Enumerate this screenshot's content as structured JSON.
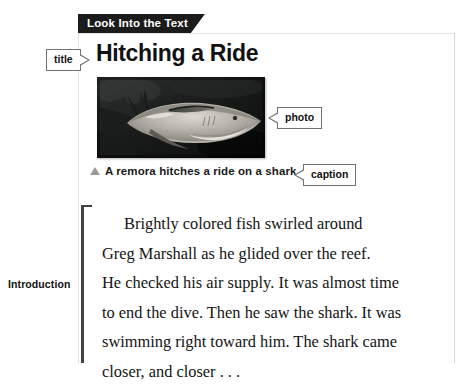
{
  "section_tab": {
    "label": "Look Into the Text"
  },
  "article": {
    "title": "Hitching a Ride",
    "caption": "A remora hitches a ride on a shark.",
    "caption_marker_icon": "triangle-up-icon",
    "photo_alt": "grayscale photo of a remora attached to a shark underwater"
  },
  "callouts": [
    {
      "id": "title",
      "label": "title",
      "pointer": "right"
    },
    {
      "id": "photo",
      "label": "photo",
      "pointer": "left"
    },
    {
      "id": "caption",
      "label": "caption",
      "pointer": "left"
    }
  ],
  "margin_annotation": {
    "label": "Introduction"
  },
  "body": {
    "lines": [
      "Brightly colored fish swirled around",
      "Greg Marshall as he glided over the reef.",
      "He checked his air supply. It was almost time",
      "to end the dive. Then he saw the shark. It was",
      "swimming right toward him. The shark came",
      "closer, and closer . . ."
    ]
  },
  "colors": {
    "tab_background": "#1b1b1b",
    "tab_text": "#ffffff",
    "callout_border": "#6d7377",
    "bracket": "#404346",
    "caption_marker": "#9a9a9a",
    "text": "#141414",
    "page_background": "#ffffff"
  }
}
